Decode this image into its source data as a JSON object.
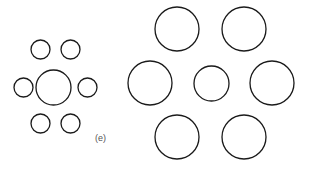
{
  "figure": {
    "panel_label": "(e)",
    "panel_label_x": 95,
    "panel_label_y": 133,
    "background_color": "#ffffff",
    "stroke_color": "#1a1a1a",
    "fill_color": "#ffffff",
    "label_color": "#555555",
    "stroke_width": 1.3,
    "width": 309,
    "height": 170
  },
  "chart_data": {
    "type": "scatter",
    "subtitle": "Two identical central circles flanked by small vs. large inducers",
    "xlabel": "",
    "ylabel": "",
    "xlim": [
      0,
      309
    ],
    "ylim": [
      0,
      170
    ],
    "grid": false,
    "legend": "none",
    "annotations": [
      {
        "text": "(e)",
        "x": 95,
        "y": 133
      }
    ],
    "series": [
      {
        "name": "left-target-circle",
        "role": "target",
        "radius": 17.5,
        "points": [
          {
            "cx": 53.5,
            "cy": 87.5,
            "r": 17.5
          }
        ]
      },
      {
        "name": "left-inducer-circles-small",
        "role": "inducer",
        "radius": 9.5,
        "points": [
          {
            "cx": 40.5,
            "cy": 49.5,
            "r": 9.5
          },
          {
            "cx": 70.5,
            "cy": 49.5,
            "r": 9.5
          },
          {
            "cx": 23.5,
            "cy": 87.5,
            "r": 9.5
          },
          {
            "cx": 87.5,
            "cy": 87.5,
            "r": 9.5
          },
          {
            "cx": 40.5,
            "cy": 123.5,
            "r": 9.5
          },
          {
            "cx": 70.5,
            "cy": 123.5,
            "r": 9.5
          }
        ]
      },
      {
        "name": "right-target-circle",
        "role": "target",
        "radius": 17.5,
        "points": [
          {
            "cx": 211.5,
            "cy": 83.5,
            "r": 17.5
          }
        ]
      },
      {
        "name": "right-inducer-circles-large",
        "role": "inducer",
        "radius": 22,
        "points": [
          {
            "cx": 177.0,
            "cy": 29.0,
            "r": 22
          },
          {
            "cx": 244.0,
            "cy": 29.0,
            "r": 22
          },
          {
            "cx": 150.0,
            "cy": 83.0,
            "r": 22
          },
          {
            "cx": 272.0,
            "cy": 83.0,
            "r": 22
          },
          {
            "cx": 177.0,
            "cy": 137.0,
            "r": 22
          },
          {
            "cx": 244.0,
            "cy": 137.0,
            "r": 22
          }
        ]
      }
    ]
  }
}
